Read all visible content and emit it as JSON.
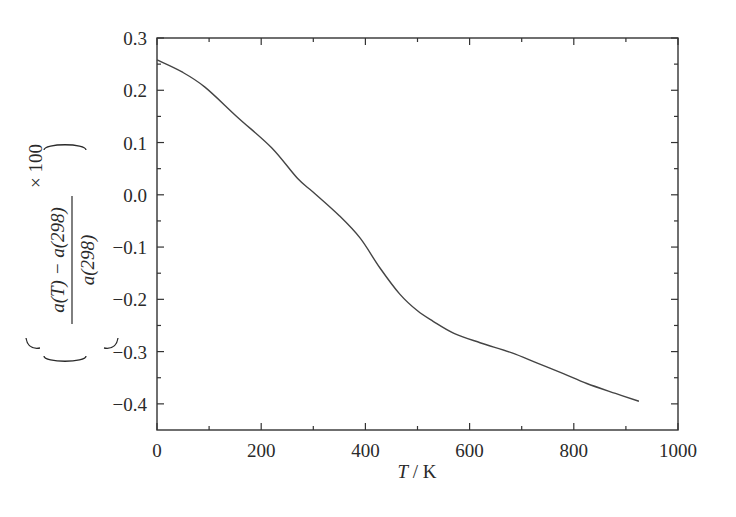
{
  "chart_data": {
    "type": "line",
    "title": "",
    "xlabel": "T / K",
    "xlabel_parts": {
      "var": "T",
      "unit": " / K"
    },
    "ylabel": "((a(T) − a(298)) / a(298)) × 100",
    "ylabel_parts": {
      "numerator": "a(T) − a(298)",
      "denominator": "a(298)",
      "multiplier": "× 100"
    },
    "xlim": [
      0,
      1000
    ],
    "ylim": [
      -0.45,
      0.3
    ],
    "xticks": [
      0,
      200,
      400,
      600,
      800,
      1000
    ],
    "xtick_labels": [
      "0",
      "200",
      "400",
      "600",
      "800",
      "1000"
    ],
    "x_minor_ticks": [
      100,
      300,
      500,
      700,
      900
    ],
    "yticks": [
      0.3,
      0.2,
      0.1,
      0.0,
      -0.1,
      -0.2,
      -0.3,
      -0.4
    ],
    "ytick_labels": [
      "0.3",
      "0.2",
      "0.1",
      "0.0",
      "−0.1",
      "−0.2",
      "−0.3",
      "−0.4"
    ],
    "y_minor_ticks": [
      0.25,
      0.15,
      0.05,
      -0.05,
      -0.15,
      -0.25,
      -0.35
    ],
    "grid": false,
    "legend": null,
    "series": [
      {
        "name": "relative lattice parameter change",
        "color": "#444444",
        "x": [
          0,
          48,
          92,
          155,
          220,
          270,
          300,
          350,
          390,
          428,
          466,
          500,
          530,
          570,
          620,
          680,
          730,
          780,
          825,
          880,
          925
        ],
        "y": [
          0.258,
          0.235,
          0.206,
          0.148,
          0.09,
          0.031,
          0.005,
          -0.04,
          -0.083,
          -0.14,
          -0.19,
          -0.222,
          -0.242,
          -0.265,
          -0.283,
          -0.302,
          -0.322,
          -0.342,
          -0.361,
          -0.38,
          -0.395
        ]
      }
    ]
  }
}
